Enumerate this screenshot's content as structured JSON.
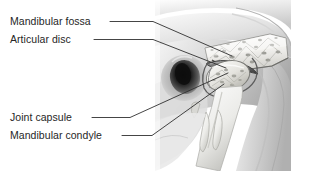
{
  "figure": {
    "background_color": "#ffffff",
    "label_color": "#262626",
    "leader_color": "#303030",
    "illustration_style": "grayscale medical illustration",
    "illustration_region": {
      "x": 155,
      "y": 0,
      "width": 135,
      "height": 171
    }
  },
  "labels": [
    {
      "id": "mandibular-fossa",
      "text": "Mandibular fossa",
      "text_x": 10,
      "text_y": 25,
      "leader": "M 110 21.5 L 153 21.5 L 232 56",
      "target": "temporal bone mandibular fossa"
    },
    {
      "id": "articular-disc",
      "text": "Articular disc",
      "text_x": 10,
      "text_y": 43,
      "leader": "M 94 39.5 L 153 39.5 L 226 68",
      "target": "fibrocartilage articular disc"
    },
    {
      "id": "joint-capsule",
      "text": "Joint capsule",
      "text_x": 10,
      "text_y": 121,
      "leader": "M 92 117.5 L 130 117.5 L 228 73",
      "target": "fibrous joint capsule"
    },
    {
      "id": "mandibular-condyle",
      "text": "Mandibular condyle",
      "text_x": 10,
      "text_y": 139,
      "leader": "M 122 135.5 L 152 135.5 L 224 84",
      "target": "condylar head of mandible"
    }
  ],
  "anatomy_parts": [
    {
      "id": "skull-base",
      "name": "Skull base / zygomatic arch"
    },
    {
      "id": "temporal-bone-cut",
      "name": "Cut temporal bone with trabecular spongy bone"
    },
    {
      "id": "external-auditory-meatus",
      "name": "External auditory meatus (dark canal)"
    },
    {
      "id": "articular-disc-shape",
      "name": "Articular disc"
    },
    {
      "id": "condyle-head",
      "name": "Mandibular condyle head with trabecular bone"
    },
    {
      "id": "mandibular-ramus",
      "name": "Mandibular ramus"
    },
    {
      "id": "teeth",
      "name": "Teeth / coronoid region"
    },
    {
      "id": "soft-tissue",
      "name": "Surrounding soft tissue / neck"
    }
  ],
  "palette": {
    "white": "#ffffff",
    "light_gray": "#e3e3e3",
    "mid_gray": "#bdbdbd",
    "dark_gray": "#6e6e6e",
    "shadow": "#3a3a3a",
    "near_black": "#141414",
    "bone_light": "#f2f2f0",
    "bone_shade": "#cfcfcb"
  }
}
